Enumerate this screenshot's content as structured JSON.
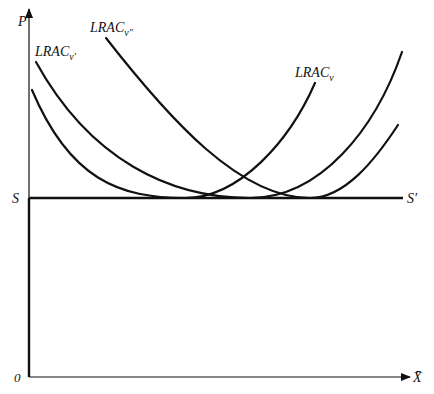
{
  "diagram": {
    "axes": {
      "y_label": "P",
      "x_label": "X̄",
      "origin_label": "0"
    },
    "supply_line": {
      "left_label": "S",
      "right_label": "S′"
    },
    "curves": [
      {
        "id": "lrac-v",
        "label_main": "LRAC",
        "label_sub": "v"
      },
      {
        "id": "lrac-v-prime",
        "label_main": "LRAC",
        "label_sub": "v′"
      },
      {
        "id": "lrac-v-double-prime",
        "label_main": "LRAC",
        "label_sub": "v″"
      }
    ],
    "colors": {
      "line": "#111111",
      "background": "#ffffff"
    }
  }
}
